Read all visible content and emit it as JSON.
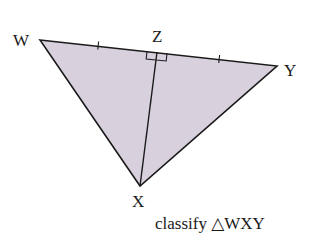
{
  "diagram": {
    "type": "geometry-triangle",
    "fill_color": "#d9d0de",
    "stroke_color": "#1a1a1a",
    "vertices": {
      "W": {
        "label": "W",
        "x": 40,
        "y": 40
      },
      "Y": {
        "label": "Y",
        "x": 277,
        "y": 66
      },
      "X": {
        "label": "X",
        "x": 140,
        "y": 186
      }
    },
    "foot_point": {
      "label": "Z",
      "x": 157,
      "y": 52
    },
    "segments": [
      "WY",
      "WX",
      "XY",
      "XZ"
    ],
    "marks": {
      "right_angle_at": "Z",
      "congruent_ticks": [
        "WZ",
        "ZY"
      ]
    },
    "caption": "classify △WXY"
  }
}
